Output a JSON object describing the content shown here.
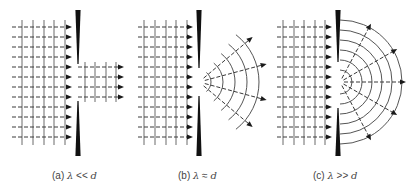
{
  "figure": {
    "colors": {
      "ink": "#3a3a3a",
      "barrier": "#111111",
      "background": "#ffffff"
    },
    "panels": [
      {
        "id": "a",
        "caption": {
          "prefix": "(a) ",
          "lambda": "λ",
          "relation": " << ",
          "d": "d",
          "x": 52
        },
        "type": "plane",
        "barrier": {
          "x": 78,
          "top": 10,
          "bottom": 156,
          "gap_top": 64,
          "gap_bottom": 101
        },
        "rays_y": [
          27,
          37,
          47,
          57,
          67,
          77,
          87,
          97,
          107,
          117,
          127,
          137
        ],
        "ray_x_start": 12,
        "arrow_x": 72,
        "wavefronts_x": [
          22,
          33,
          44,
          54,
          65
        ],
        "wave_top": 20,
        "wave_bottom": 145,
        "pass": {
          "rays_y": [
            67,
            77,
            87,
            97
          ],
          "x_end": 124,
          "wavefronts_x": [
            85,
            95,
            106,
            116
          ]
        }
      },
      {
        "id": "b",
        "caption": {
          "prefix": "(b) ",
          "lambda": "λ",
          "relation": " ≈ ",
          "d": "d",
          "x": 178
        },
        "type": "fan",
        "barrier": {
          "x": 199,
          "top": 10,
          "bottom": 156,
          "gap_top": 68,
          "gap_bottom": 96
        },
        "rays_y": [
          27,
          37,
          47,
          57,
          67,
          77,
          87,
          97,
          107,
          117,
          127,
          137
        ],
        "ray_x_start": 138,
        "arrow_x": 193,
        "wavefronts_x": [
          144,
          155,
          166,
          176,
          187
        ],
        "wave_top": 20,
        "wave_bottom": 145,
        "diffraction": {
          "cx": 199,
          "cy": 82,
          "radii": [
            12,
            24,
            36,
            48,
            60
          ],
          "arc_span_deg": 52,
          "ray_angles_deg": [
            -40,
            -15,
            15,
            40
          ],
          "ray_start_r": 6,
          "ray_end_r": 70
        }
      },
      {
        "id": "c",
        "caption": {
          "prefix": "(c) ",
          "lambda": "λ",
          "relation": " >> ",
          "d": "d",
          "x": 313
        },
        "type": "semicircle",
        "barrier": {
          "x": 338,
          "top": 10,
          "bottom": 156,
          "gap_top": 62,
          "gap_bottom": 108
        },
        "rays_y": [
          27,
          37,
          47,
          57,
          67,
          77,
          87,
          97,
          107,
          117,
          127,
          137
        ],
        "ray_x_start": 277,
        "arrow_x": 332,
        "wavefronts_x": [
          283,
          294,
          304,
          315,
          325
        ],
        "wave_top": 20,
        "wave_bottom": 145,
        "diffraction": {
          "cx": 340,
          "cy": 82,
          "radii": [
            12,
            22,
            32,
            42,
            52,
            62
          ],
          "arc_span_deg": 90,
          "ray_angles_deg": [
            -62,
            -30,
            0,
            30,
            62
          ],
          "ray_start_r": 4,
          "ray_end_r": 66
        }
      }
    ]
  }
}
